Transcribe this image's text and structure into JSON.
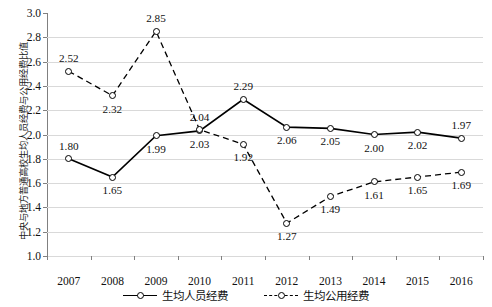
{
  "chart_data": {
    "type": "line",
    "title": "",
    "xlabel": "",
    "ylabel": "中央与地方普通高校生均人员经费与公用经费比值",
    "x": [
      "2007",
      "2008",
      "2009",
      "2010",
      "2011",
      "2012",
      "2013",
      "2014",
      "2015",
      "2016"
    ],
    "categories": [
      "2007",
      "2008",
      "2009",
      "2010",
      "2011",
      "2012",
      "2013",
      "2014",
      "2015",
      "2016"
    ],
    "ylim": [
      1.0,
      3.0
    ],
    "ytick_step": 0.2,
    "yticks": [
      "3.0",
      "2.8",
      "2.6",
      "2.4",
      "2.2",
      "2.0",
      "1.8",
      "1.6",
      "1.4",
      "1.2",
      "1.0"
    ],
    "grid": "horizontal",
    "legend_position": "bottom-center",
    "series": [
      {
        "name": "生均人员经费",
        "style": "solid",
        "marker": "open-circle",
        "color": "#000000",
        "values": [
          1.8,
          1.65,
          1.99,
          2.03,
          2.29,
          2.06,
          2.05,
          2.0,
          2.02,
          1.97
        ],
        "labels": [
          "1.80",
          "1.65",
          "1.99",
          "2.03",
          "2.29",
          "2.06",
          "2.05",
          "2.00",
          "2.02",
          "1.97"
        ],
        "label_positions": [
          "above",
          "below",
          "below",
          "below",
          "above",
          "below",
          "below",
          "below",
          "below",
          "above"
        ]
      },
      {
        "name": "生均公用经费",
        "style": "dashed",
        "marker": "open-circle",
        "color": "#000000",
        "values": [
          2.52,
          2.32,
          2.85,
          2.04,
          1.92,
          1.27,
          1.49,
          1.61,
          1.65,
          1.69
        ],
        "labels": [
          "2.52",
          "2.32",
          "2.85",
          "2.04",
          "1.92",
          "1.27",
          "1.49",
          "1.61",
          "1.65",
          "1.69"
        ],
        "label_positions": [
          "above",
          "below",
          "above",
          "above",
          "below",
          "below",
          "below",
          "below",
          "below",
          "below"
        ]
      }
    ]
  },
  "legend": {
    "items": [
      {
        "label": "生均人员经费",
        "style": "solid"
      },
      {
        "label": "生均公用经费",
        "style": "dashed"
      }
    ]
  },
  "axes": {
    "y_title": "中央与地方普通高校生均人员经费与公用经费比值"
  }
}
